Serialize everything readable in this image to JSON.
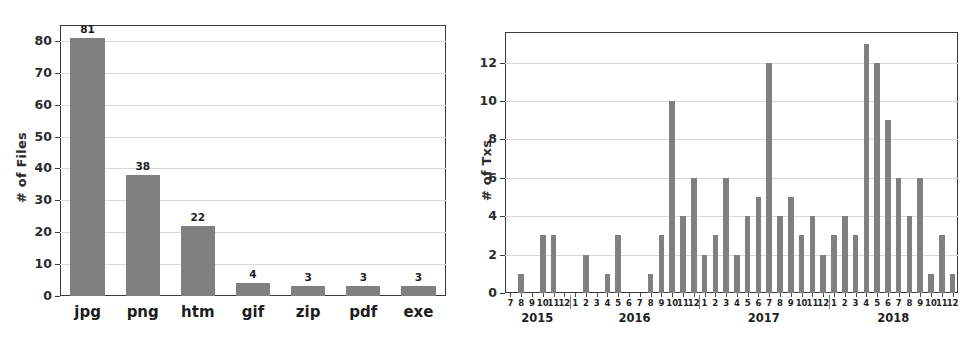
{
  "figure": {
    "background": "#ffffff",
    "bar_color": "#808080",
    "axis_color": "#3a3a3a",
    "grid_color": "#d9d9d9"
  },
  "panels": {
    "files": {
      "ylabel": "# of Files"
    },
    "txs": {
      "ylabel": "# of Txs"
    }
  },
  "chart_data": [
    {
      "type": "bar",
      "title": "",
      "xlabel": "",
      "ylabel": "# of Files",
      "categories": [
        "jpg",
        "png",
        "htm",
        "gif",
        "zip",
        "pdf",
        "exe"
      ],
      "values": [
        81,
        38,
        22,
        4,
        3,
        3,
        3
      ],
      "bar_labels": [
        "81",
        "38",
        "22",
        "4",
        "3",
        "3",
        "3"
      ],
      "yticks": [
        0,
        10,
        20,
        30,
        40,
        50,
        60,
        70,
        80
      ],
      "ytick_labels": [
        "0",
        "10",
        "20",
        "30",
        "40",
        "50",
        "60",
        "70",
        "80"
      ],
      "ylim": [
        0,
        85
      ],
      "grid": true,
      "legend": "none",
      "bar_color": "#808080"
    },
    {
      "type": "bar",
      "title": "",
      "xlabel": "",
      "ylabel": "# of Txs",
      "yticks": [
        0,
        2,
        4,
        6,
        8,
        10,
        12
      ],
      "ytick_labels": [
        "0",
        "2",
        "4",
        "6",
        "8",
        "10",
        "12"
      ],
      "ylim": [
        0,
        13.6
      ],
      "grid": true,
      "legend": "none",
      "bar_color": "#808080",
      "year_groups": [
        {
          "year": "2015",
          "months": [
            "7",
            "8",
            "9",
            "10",
            "11",
            "12"
          ],
          "values": [
            0,
            1,
            0,
            3,
            3,
            0
          ]
        },
        {
          "year": "2016",
          "months": [
            "1",
            "2",
            "3",
            "4",
            "5",
            "6",
            "7",
            "8",
            "9",
            "10",
            "11",
            "12"
          ],
          "values": [
            0,
            2,
            0,
            1,
            3,
            0,
            0,
            1,
            3,
            10,
            4,
            6
          ]
        },
        {
          "year": "2017",
          "months": [
            "1",
            "2",
            "3",
            "4",
            "5",
            "6",
            "7",
            "8",
            "9",
            "10",
            "11",
            "12"
          ],
          "values": [
            2,
            3,
            6,
            2,
            4,
            5,
            12,
            4,
            5,
            3,
            4,
            2
          ]
        },
        {
          "year": "2018",
          "months": [
            "1",
            "2",
            "3",
            "4",
            "5",
            "6",
            "7",
            "8",
            "9",
            "10",
            "11",
            "12"
          ],
          "values": [
            3,
            4,
            3,
            13,
            12,
            9,
            6,
            4,
            6,
            1,
            3,
            1
          ]
        }
      ]
    }
  ]
}
